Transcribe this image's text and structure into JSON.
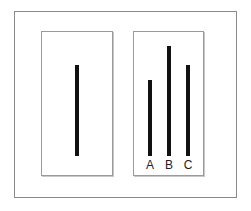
{
  "diagram": {
    "reference_card": {
      "line_length_px": 91
    },
    "comparison_card": {
      "lines": [
        {
          "label": "A",
          "length_px": 76
        },
        {
          "label": "B",
          "length_px": 110
        },
        {
          "label": "C",
          "length_px": 91
        }
      ]
    },
    "colors": {
      "line": "#111111",
      "border": "#8a8a8a",
      "background": "#ffffff"
    }
  }
}
